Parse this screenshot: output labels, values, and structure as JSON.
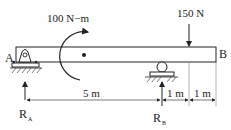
{
  "diagram": {
    "type": "beam-free-body",
    "labels": {
      "end_a": "A",
      "end_b": "B",
      "moment": "100 N−m",
      "load": "150 N",
      "reaction_a": "R",
      "reaction_a_sub": "A",
      "reaction_b": "R",
      "reaction_b_sub": "B",
      "dim_ab": "5 m",
      "dim_b_load": "1 m",
      "dim_load_end": "1 m"
    },
    "elements": {
      "beam": {
        "from": "A",
        "to": "B"
      },
      "support_a": "pin",
      "support_b": "roller",
      "applied_moment": {
        "value": 100,
        "unit": "N-m",
        "direction": "clockwise"
      },
      "point_load": {
        "value": 150,
        "unit": "N",
        "direction": "down"
      }
    },
    "colors": {
      "ink": "#222222",
      "background": "#ffffff"
    }
  }
}
